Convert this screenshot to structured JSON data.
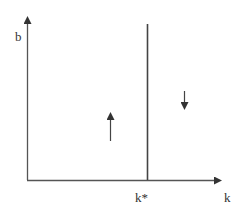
{
  "diagram": {
    "y_axis_label": "b",
    "x_axis_label": "k",
    "threshold_label": "k*",
    "left_region_arrow": "up",
    "right_region_arrow": "down",
    "line_color": "#444444"
  }
}
